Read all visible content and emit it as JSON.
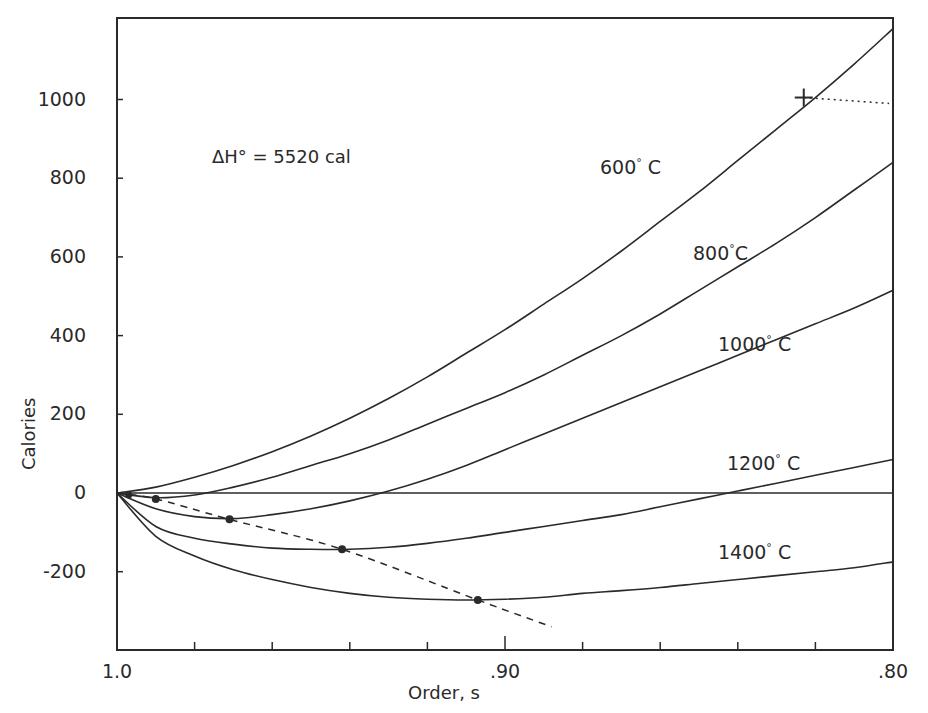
{
  "chart_data": {
    "type": "line",
    "title": "",
    "xlabel": "Order, s",
    "ylabel": "Calories",
    "xlim": [
      1.0,
      0.8
    ],
    "ylim": [
      -360,
      1200
    ],
    "x_axis_reversed": true,
    "grid": false,
    "x_ticks": [
      1.0,
      0.98,
      0.96,
      0.94,
      0.92,
      0.9,
      0.88,
      0.86,
      0.84,
      0.82,
      0.8
    ],
    "x_tick_labels": [
      {
        "value": 1.0,
        "label": "1.0"
      },
      {
        "value": 0.9,
        "label": ".90"
      },
      {
        "value": 0.8,
        "label": ".80"
      }
    ],
    "y_ticks": [
      1000,
      800,
      600,
      400,
      200,
      0,
      -200
    ],
    "y_tick_labels": [
      "1000",
      "800",
      "600",
      "400",
      "200",
      "0",
      "-200"
    ],
    "annotation": "ΔH° = 5520 cal",
    "x": [
      1.0,
      0.99,
      0.98,
      0.97,
      0.96,
      0.95,
      0.94,
      0.93,
      0.92,
      0.91,
      0.9,
      0.89,
      0.88,
      0.87,
      0.86,
      0.85,
      0.84,
      0.83,
      0.82,
      0.81,
      0.8
    ],
    "series": [
      {
        "name": "600° C",
        "label_text": "600",
        "label_suffix": " C",
        "values": [
          0,
          15,
          40,
          70,
          105,
          145,
          190,
          240,
          295,
          355,
          415,
          480,
          545,
          615,
          690,
          765,
          845,
          925,
          1005,
          1090,
          1180
        ]
      },
      {
        "name": "800° C",
        "label_text": "800",
        "label_suffix": "C",
        "values": [
          0,
          -12,
          -5,
          15,
          40,
          70,
          100,
          135,
          175,
          215,
          255,
          300,
          350,
          400,
          455,
          515,
          575,
          635,
          700,
          770,
          840
        ]
      },
      {
        "name": "1000° C",
        "label_text": "1000",
        "label_suffix": " C",
        "values": [
          0,
          -40,
          -60,
          -65,
          -55,
          -40,
          -20,
          5,
          35,
          70,
          110,
          150,
          190,
          230,
          270,
          310,
          350,
          390,
          430,
          470,
          515
        ]
      },
      {
        "name": "1200° C",
        "label_text": "1200",
        "label_suffix": " C",
        "values": [
          0,
          -85,
          -115,
          -130,
          -140,
          -143,
          -143,
          -138,
          -128,
          -115,
          -100,
          -85,
          -70,
          -55,
          -35,
          -15,
          5,
          25,
          45,
          65,
          85
        ]
      },
      {
        "name": "1400° C",
        "label_text": "1400",
        "label_suffix": " C",
        "values": [
          0,
          -110,
          -160,
          -195,
          -220,
          -240,
          -255,
          -265,
          -270,
          -272,
          -270,
          -265,
          -255,
          -248,
          -240,
          -230,
          -220,
          -210,
          -200,
          -190,
          -175
        ]
      },
      {
        "name": "zero line",
        "label_text": "",
        "label_suffix": "",
        "values": [
          0,
          0,
          0,
          0,
          0,
          0,
          0,
          0,
          0,
          0,
          0,
          0,
          0,
          0,
          0,
          0,
          0,
          0,
          0,
          0,
          0
        ]
      }
    ],
    "minima_points": [
      {
        "series": "800° C",
        "x": 0.99,
        "y": -15
      },
      {
        "series": "1000° C",
        "x": 0.971,
        "y": -67
      },
      {
        "series": "1200° C",
        "x": 0.942,
        "y": -143
      },
      {
        "series": "1400° C",
        "x": 0.907,
        "y": -272
      }
    ],
    "minima_locus_dashed": {
      "x": [
        1.0,
        0.99,
        0.971,
        0.942,
        0.907,
        0.888
      ],
      "y": [
        0,
        -15,
        -67,
        -143,
        -272,
        -340
      ]
    },
    "marker_plus": {
      "x": 0.823,
      "y": 1005
    },
    "dotted_line_from_plus": {
      "x": [
        0.823,
        0.801
      ],
      "y": [
        1005,
        990
      ]
    }
  }
}
